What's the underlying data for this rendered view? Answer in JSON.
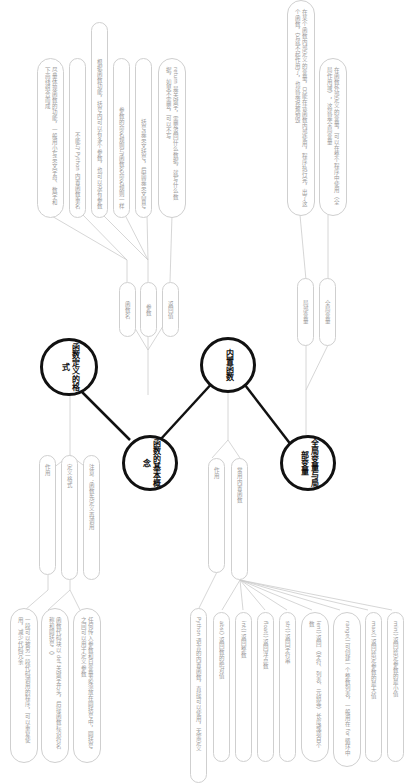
{
  "map": {
    "orientation": "rotated-90-clockwise",
    "hubs": {
      "definition": "函数定义的格式",
      "basics": "函数的基本概念",
      "builtin": "内置函数",
      "scope": "全局变量与局部变量"
    },
    "definition_branch": {
      "name_label": "函数名",
      "param_label": "参数",
      "return_label": "返回值",
      "name_notes": [
        "尽量体现函数的功能，一般用小写英文字母、数字和下画线组合而成",
        "不能与 Python 内置函数重名"
      ],
      "param_notes": [
        "根据函数功能，括号内可以有多个参数，也可以没有参数",
        "参数的命名规则与函数名命名规则一样",
        "括号是英文括号，后面是英文冒号"
      ],
      "return_notes": [
        "return 是关键字，需要返回什么数据，就写什么数据，如果不需要，可以不写"
      ]
    },
    "basics_branch": {
      "role_label": "作用",
      "format_label": "定义格式",
      "note_label": "注意：函数先定义再调用",
      "role_notes": [
        "一段可以被另一段代码调用的程序，可以重复使用，减少代码冗余"
      ],
      "format_notes": [
        "函数代码块以 def 关键字开头，后接函数标识符名称和圆括号（）",
        "任何传入参数和自变量必须放在圆括号中，圆括号之间可以用于定义参数"
      ]
    },
    "builtin_branch": {
      "role_label": "作用",
      "common_label": "常用内置函数",
      "role_notes": [
        "Python 语言的内置函数，直接可以使用，无需定义"
      ],
      "common_items": [
        "abs() 返回数的绝对值",
        "int() 返回整数",
        "float() 返回浮点数",
        "str() 返回字符串",
        "len() 返回（字符、列表、元组等）长度或项目个数",
        "range() 可创建一个整数列表，一般用在 for 循环中",
        "max() 返回给定参数的最大值",
        "min() 返回给定参数的最小值"
      ]
    },
    "scope_branch": {
      "local_label": "局部变量",
      "global_label": "全局变量",
      "local_notes": [
        "在某个函数内部定义的变量，只能在该函数内部使用，程序执行完，出了这个函数，它就不起作用了，也就是说被销毁"
      ],
      "global_notes": [
        "在函数外部定义的变量，可以在整个程序中使用（全局作用域），这就是全局变量"
      ]
    },
    "colors": {
      "hub_border": "#111111",
      "pill_border": "#cfcfcf",
      "pill_text": "#9a9a9a",
      "line": "#cccccc"
    }
  }
}
